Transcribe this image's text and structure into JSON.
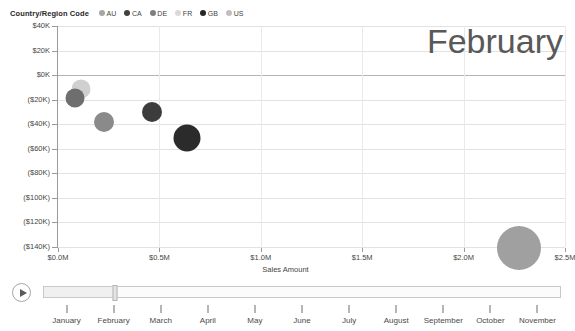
{
  "legend": {
    "title": "Country/Region Code",
    "items": [
      {
        "label": "AU",
        "color": "#a6a6a6"
      },
      {
        "label": "CA",
        "color": "#404040"
      },
      {
        "label": "DE",
        "color": "#7f7f7f"
      },
      {
        "label": "FR",
        "color": "#d9d9d9"
      },
      {
        "label": "GB",
        "color": "#262626"
      },
      {
        "label": "US",
        "color": "#bfbfbf"
      }
    ]
  },
  "watermark": "February",
  "chart_data": {
    "type": "scatter",
    "title": "",
    "xlabel": "Sales Amount",
    "ylabel": "Sales Profit",
    "xlim": [
      0,
      2500000
    ],
    "ylim": [
      -140000,
      40000
    ],
    "x_ticks": [
      0,
      500000,
      1000000,
      1500000,
      2000000,
      2500000
    ],
    "x_tick_labels": [
      "$0.0M",
      "$0.5M",
      "$1.0M",
      "$1.5M",
      "$2.0M",
      "$2.5M"
    ],
    "y_ticks": [
      40000,
      20000,
      0,
      -20000,
      -40000,
      -60000,
      -80000,
      -100000,
      -120000,
      -140000
    ],
    "y_tick_labels": [
      "$40K",
      "$20K",
      "$0K",
      "($20K)",
      "($40K)",
      "($60K)",
      "($80K)",
      "($100K)",
      "($120K)",
      "($140K)"
    ],
    "grid": true,
    "legend_position": "top",
    "bubble_size_field": "Sales Quantity",
    "points": [
      {
        "name": "FR",
        "x": 115000,
        "y": -11000,
        "size": 19,
        "color": "#d0d0d0"
      },
      {
        "name": "DE",
        "x": 85000,
        "y": -19000,
        "size": 19,
        "color": "#6e6e6e"
      },
      {
        "name": "AU",
        "x": 225000,
        "y": -38000,
        "size": 20,
        "color": "#8a8a8a"
      },
      {
        "name": "CA",
        "x": 465000,
        "y": -30000,
        "size": 20,
        "color": "#3c3c3c"
      },
      {
        "name": "GB",
        "x": 635000,
        "y": -51000,
        "size": 27,
        "color": "#2b2b2b"
      },
      {
        "name": "US",
        "x": 2275000,
        "y": -141000,
        "size": 44,
        "color": "#a0a0a0"
      }
    ]
  },
  "timeline": {
    "play_label": "play-animation",
    "current_month": "February",
    "months": [
      "January",
      "February",
      "March",
      "April",
      "May",
      "June",
      "July",
      "August",
      "September",
      "October",
      "November"
    ]
  }
}
